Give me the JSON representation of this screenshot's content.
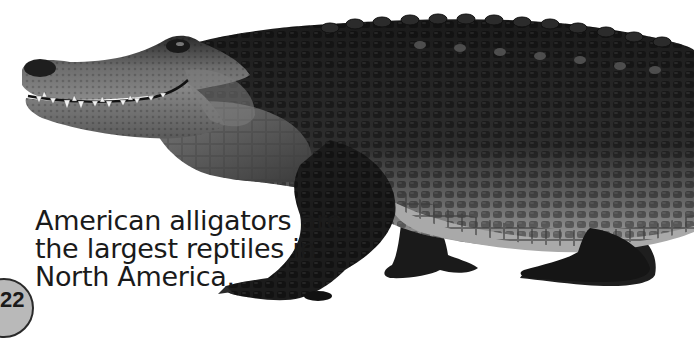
{
  "page": {
    "caption_lines": [
      "American alligators are",
      "the largest reptiles in",
      "North America."
    ],
    "page_number": "22",
    "image_subject": "American alligator walking, side view"
  },
  "colors": {
    "background": "#ffffff",
    "text": "#1a1a1a",
    "page_badge_fill": "#b9b9b9",
    "page_badge_border": "#2a2a2a",
    "skin_dark": "#1c1c1c",
    "skin_mid": "#555555",
    "skin_light": "#9a9a9a",
    "belly": "#b8b8b8"
  }
}
